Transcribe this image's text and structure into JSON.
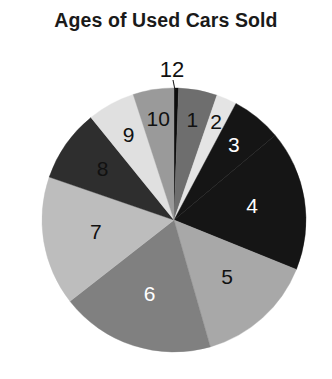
{
  "chart_data": {
    "type": "pie",
    "title": "Ages of Used Cars Sold",
    "xlabel": "",
    "ylabel": "",
    "legend": "none",
    "grid": false,
    "label_position": "inside-and-callout",
    "start_angle_deg": 0,
    "direction": "clockwise",
    "categories": [
      "12",
      "1",
      "2",
      "3",
      "4",
      "5",
      "6",
      "7",
      "8",
      "9",
      "10"
    ],
    "values": [
      2,
      17,
      9,
      22,
      62,
      52,
      68,
      57,
      32,
      21,
      18
    ],
    "value_unit": "degrees",
    "slices": [
      {
        "label": "12",
        "angle_deg": 2,
        "percent": 0.6,
        "color": "#0d0d0d",
        "label_color": "#111111",
        "label_inside": false
      },
      {
        "label": "1",
        "angle_deg": 17,
        "percent": 4.7,
        "color": "#6e6e6e",
        "label_color": "#111111",
        "label_inside": true
      },
      {
        "label": "2",
        "angle_deg": 9,
        "percent": 2.5,
        "color": "#e4e4e4",
        "label_color": "#111111",
        "label_inside": true
      },
      {
        "label": "3",
        "angle_deg": 22,
        "percent": 6.1,
        "color": "#151515",
        "label_color": "#ffffff",
        "label_inside": true
      },
      {
        "label": "4",
        "angle_deg": 62,
        "percent": 17.2,
        "color": "#151515",
        "label_color": "#ffffff",
        "label_inside": true
      },
      {
        "label": "5",
        "angle_deg": 52,
        "percent": 14.4,
        "color": "#a8a8a8",
        "label_color": "#111111",
        "label_inside": true
      },
      {
        "label": "6",
        "angle_deg": 68,
        "percent": 18.9,
        "color": "#808080",
        "label_color": "#ffffff",
        "label_inside": true
      },
      {
        "label": "7",
        "angle_deg": 57,
        "percent": 15.8,
        "color": "#bdbdbd",
        "label_color": "#111111",
        "label_inside": true
      },
      {
        "label": "8",
        "angle_deg": 32,
        "percent": 8.9,
        "color": "#2e2e2e",
        "label_color": "#111111",
        "label_inside": true
      },
      {
        "label": "9",
        "angle_deg": 21,
        "percent": 5.8,
        "color": "#e0e0e0",
        "label_color": "#111111",
        "label_inside": true
      },
      {
        "label": "10",
        "angle_deg": 18,
        "percent": 5.0,
        "color": "#9a9a9a",
        "label_color": "#111111",
        "label_inside": true
      }
    ]
  },
  "geometry": {
    "center_x": 174,
    "center_y": 220,
    "radius": 132
  },
  "callout": {
    "label": "12",
    "text_x": 172,
    "text_y": 71,
    "line_x1": 173,
    "line_y1": 80,
    "line_x2": 175,
    "line_y2": 90
  },
  "style": {
    "background": "#ffffff",
    "title_color": "#1a1a1a"
  }
}
